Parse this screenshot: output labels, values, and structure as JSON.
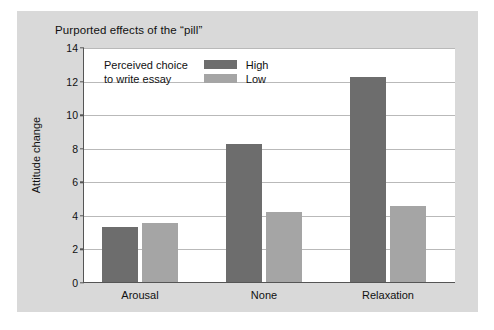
{
  "figure": {
    "background_color": "#d9d9d9",
    "plot_background_color": "#ffffff"
  },
  "chart_data": {
    "type": "bar",
    "title": "Purported effects of the “pill”",
    "xlabel": "",
    "ylabel": "Attitude change",
    "categories": [
      "Arousal",
      "None",
      "Relaxation"
    ],
    "series": [
      {
        "name": "High",
        "color": "#6d6d6d",
        "values": [
          3.3,
          8.2,
          12.2
        ]
      },
      {
        "name": "Low",
        "color": "#a5a5a5",
        "values": [
          3.5,
          4.2,
          4.5
        ]
      }
    ],
    "ylim": [
      0,
      14
    ],
    "yticks": [
      0,
      2,
      4,
      6,
      8,
      10,
      12,
      14
    ],
    "ytick_labels": [
      "0",
      "2",
      "4",
      "6",
      "8",
      "10",
      "12",
      "14"
    ],
    "grid": true,
    "grid_color": "#b9b9b9",
    "legend": {
      "position": "upper-left-inside",
      "title_lines": [
        "Perceived choice",
        "to write essay"
      ],
      "entries": [
        {
          "label": "High",
          "color": "#6d6d6d"
        },
        {
          "label": "Low",
          "color": "#a5a5a5"
        }
      ]
    }
  }
}
